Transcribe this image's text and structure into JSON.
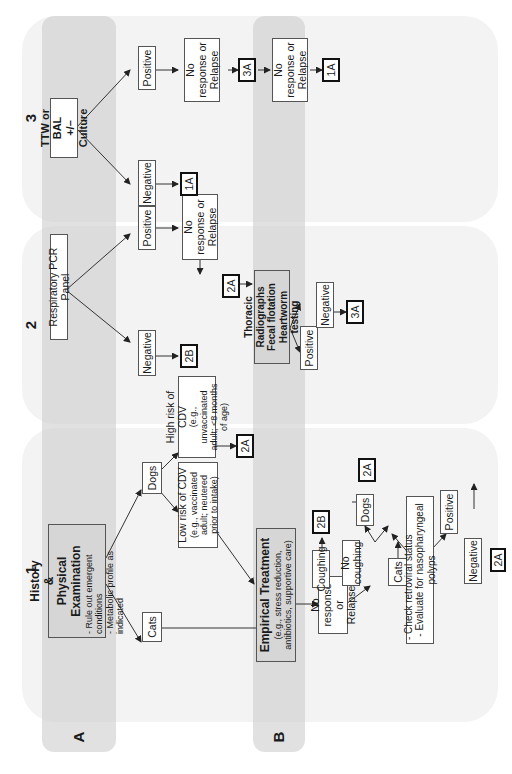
{
  "columns": [
    {
      "number": "1"
    },
    {
      "number": "2"
    },
    {
      "number": "3"
    }
  ],
  "bands": [
    {
      "label": "A"
    },
    {
      "label": "B"
    }
  ],
  "column1": {
    "history": {
      "title_line1": "History",
      "title_amp": "&",
      "title_line2": "Physical Examination",
      "bullets": [
        "- Rule out emergent conditions",
        "- Metabolic profile as indicated"
      ]
    },
    "cats": "Cats",
    "dogs": "Dogs",
    "low_risk": {
      "title": "Low risk of CDV",
      "detail": "(e.g., vaccinated adult; neutered prior to intake)"
    },
    "high_risk": {
      "title": "High risk of CDV",
      "detail": "(e.g., unvaccinated adult; <8 months of age)"
    },
    "high_risk_ref": "2A",
    "empirical": {
      "title": "Empirical Treatment",
      "detail": "(e.g., stress reduction, antibiotics, supportive care)"
    },
    "no_response": "No response or Relapse",
    "coughing": "Coughing",
    "coughing_ref": "2B",
    "no_coughing": "No coughing",
    "nc_dogs": "Dogs",
    "nc_dogs_ref": "2A",
    "nc_cats": "Cats",
    "checks": [
      "- Check retroviral status",
      "- Evaluate for nasopharyngeal polyps"
    ],
    "positive": "Positive",
    "negative": "Negative",
    "negative_ref": "2A"
  },
  "column2": {
    "pcr": "Respiratory PCR Panel",
    "negative": "Negative",
    "negative_ref": "2B",
    "positive": "Positive",
    "no_response": "No response or Relapse",
    "no_response_ref": "2A",
    "thoracic": {
      "line1": "Thoracic Radiographs",
      "line2": "Fecal flotation",
      "line3": "Heartworm testing"
    },
    "thoracic_positive": "Positive",
    "thoracic_negative": "Negative",
    "thoracic_negative_ref": "3A"
  },
  "column3": {
    "ttw": {
      "line1": "TTW or BAL",
      "line2": "+/– Culture"
    },
    "negative": "Negative",
    "negative_ref": "1A",
    "positive": "Positive",
    "no_response_1": "No response or Relapse",
    "ref_1": "3A",
    "no_response_2": "No response or Relapse",
    "ref_2": "1A"
  },
  "colors": {
    "panel_bg": "#f3f3f3",
    "band_bg": "#cfcfcf",
    "box_border": "#555555",
    "ref_border": "#111111",
    "gray_box": "#d6d6d6"
  }
}
